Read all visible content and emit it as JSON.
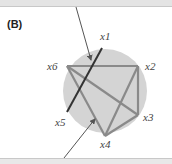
{
  "panel": {
    "label": "(B)"
  },
  "nodes": [
    {
      "id": "x1",
      "label": "x1"
    },
    {
      "id": "x2",
      "label": "x2"
    },
    {
      "id": "x3",
      "label": "x3"
    },
    {
      "id": "x4",
      "label": "x4"
    },
    {
      "id": "x5",
      "label": "x5"
    },
    {
      "id": "x6",
      "label": "x6"
    }
  ],
  "edges": [
    [
      "x6",
      "x2"
    ],
    [
      "x2",
      "x3"
    ],
    [
      "x2",
      "x4"
    ],
    [
      "x6",
      "x3"
    ],
    [
      "x6",
      "x4"
    ],
    [
      "x3",
      "x4"
    ]
  ],
  "highlight_edge": [
    "x1",
    "x5"
  ],
  "colors": {
    "circle_fill": "#d4d4d4",
    "edge": "#8a8a8a",
    "highlight_edge": "#333333",
    "arrow": "#555555",
    "bar": "#e4e4e4"
  }
}
